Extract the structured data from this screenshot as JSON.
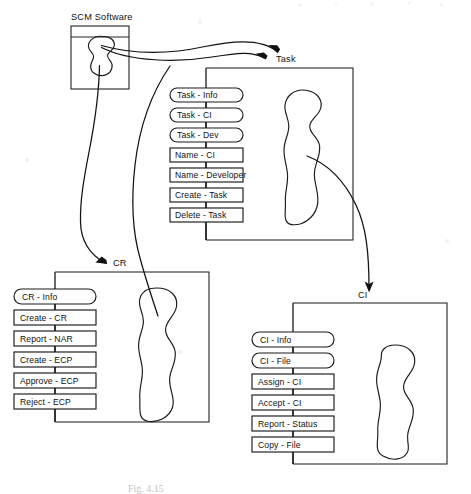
{
  "figure": {
    "kind": "structure-chart",
    "caption": "Fig. 4.15",
    "background_color": "#ffffff",
    "ink_color": "#1a1a1a"
  },
  "root": {
    "title": "SCM Software",
    "box": {
      "x": 71,
      "y": 26,
      "w": 58,
      "h": 63
    },
    "header_rule_y": 37,
    "blob_label": "scm-software-blob"
  },
  "modules": [
    {
      "id": "task",
      "title": "Task",
      "title_pos": {
        "x": 276,
        "y": 62
      },
      "box": {
        "x": 208,
        "y": 68,
        "w": 145,
        "h": 172
      },
      "spine_x": 206,
      "operations": [
        {
          "label": "Task - Info",
          "shape": "rounded"
        },
        {
          "label": "Task - CI",
          "shape": "rounded"
        },
        {
          "label": "Task - Dev",
          "shape": "rounded"
        },
        {
          "label": "Name - CI",
          "shape": "rect"
        },
        {
          "label": "Name - Developer",
          "shape": "rect"
        },
        {
          "label": "Create - Task",
          "shape": "rect"
        },
        {
          "label": "Delete - Task",
          "shape": "rect"
        }
      ]
    },
    {
      "id": "cr",
      "title": "CR",
      "title_pos": {
        "x": 121,
        "y": 265
      },
      "box": {
        "x": 57,
        "y": 272,
        "w": 153,
        "h": 150
      },
      "spine_x": 55,
      "operations": [
        {
          "label": "CR - Info",
          "shape": "rounded"
        },
        {
          "label": "Create - CR",
          "shape": "rect"
        },
        {
          "label": "Report - NAR",
          "shape": "rect"
        },
        {
          "label": "Create - ECP",
          "shape": "rect"
        },
        {
          "label": "Approve - ECP",
          "shape": "rect"
        },
        {
          "label": "Reject - ECP",
          "shape": "rect"
        }
      ]
    },
    {
      "id": "ci",
      "title": "CI",
      "title_pos": {
        "x": 363,
        "y": 297
      },
      "box": {
        "x": 295,
        "y": 303,
        "w": 152,
        "h": 161
      },
      "spine_x": 293,
      "operations": [
        {
          "label": "CI - Info",
          "shape": "rounded"
        },
        {
          "label": "CI - File",
          "shape": "rounded"
        },
        {
          "label": "Assign - CI",
          "shape": "rect"
        },
        {
          "label": "Accept - CI",
          "shape": "rect"
        },
        {
          "label": "Report - Status",
          "shape": "rect"
        },
        {
          "label": "Copy - File",
          "shape": "rect"
        }
      ]
    }
  ],
  "connections": [
    {
      "id": "scm-to-task-outer",
      "from": "scm-software-blob",
      "to": "task",
      "style": "curved-arrow"
    },
    {
      "id": "scm-to-task-inner",
      "from": "scm-software-blob",
      "to": "task",
      "style": "curved-arrow"
    },
    {
      "id": "scm-to-cr",
      "from": "scm-software-blob",
      "to": "cr",
      "style": "curved-arrow"
    },
    {
      "id": "scm-to-cr-blob",
      "from": "scm-software-blob",
      "to": "cr-blob",
      "style": "curved-line"
    },
    {
      "id": "task-to-ci",
      "from": "task-blob",
      "to": "ci",
      "style": "curved-arrow"
    }
  ]
}
